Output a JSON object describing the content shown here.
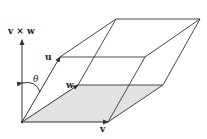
{
  "diagram": {
    "labels": {
      "cross": "v × w",
      "u": "u",
      "w": "w",
      "v": "v",
      "theta": "θ"
    },
    "colors": {
      "line": "#333333",
      "base_fill": "#e2e2e2",
      "background": "#ffffff"
    }
  }
}
